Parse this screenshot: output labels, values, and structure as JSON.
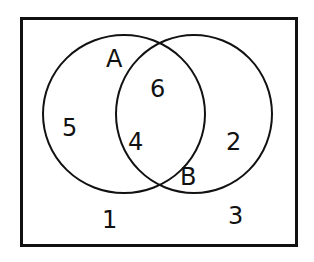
{
  "diagram": {
    "type": "venn",
    "sets": [
      {
        "name": "A",
        "label": "A"
      },
      {
        "name": "B",
        "label": "B"
      }
    ],
    "regions": {
      "only_A": "5",
      "A_and_B_top": "6",
      "A_and_B_bottom": "4",
      "only_B": "2",
      "outside_left": "1",
      "outside_right": "3"
    },
    "colors": {
      "stroke": "#111111",
      "background": "#ffffff"
    }
  }
}
